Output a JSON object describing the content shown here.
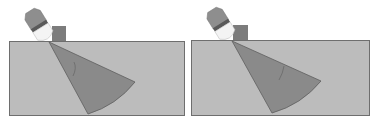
{
  "figure": {
    "width": 373,
    "height": 126,
    "background": "#ffffff",
    "colors": {
      "block_fill": "#bcbcbc",
      "block_stroke": "#6e6e6e",
      "fan_fill": "#8a8a8a",
      "fan_stroke": "#5e5e5e",
      "probe_cap": "#8e8e8e",
      "probe_band": "#5a5a5a",
      "probe_body": "#f4f4f4",
      "wedge": "#7c7c7c",
      "crack": "#6a6a6a"
    },
    "panels": [
      {
        "id": "left",
        "block": {
          "x": 9,
          "y": 41,
          "w": 175,
          "h": 74
        },
        "wedge": {
          "points": "52,26 66,26 66,41 52,41"
        },
        "probe": {
          "cx": 40,
          "cy": 27,
          "angle": -32
        },
        "fan": {
          "apex": [
            49,
            42
          ],
          "p1": [
            135,
            82
          ],
          "p2": [
            88,
            114
          ],
          "r": 96
        },
        "crack": "M74,62 Q77,68 73,76"
      },
      {
        "id": "right",
        "block": {
          "x": 191,
          "y": 40,
          "w": 178,
          "h": 75
        },
        "wedge": {
          "points": "233,25 248,25 248,40 233,40"
        },
        "probe": {
          "cx": 222,
          "cy": 26,
          "angle": -32
        },
        "fan": {
          "apex": [
            232,
            41
          ],
          "p1": [
            321,
            81
          ],
          "p2": [
            272,
            113
          ],
          "r": 98
        },
        "crack": "M284,66 Q283,73 279,80"
      }
    ]
  }
}
